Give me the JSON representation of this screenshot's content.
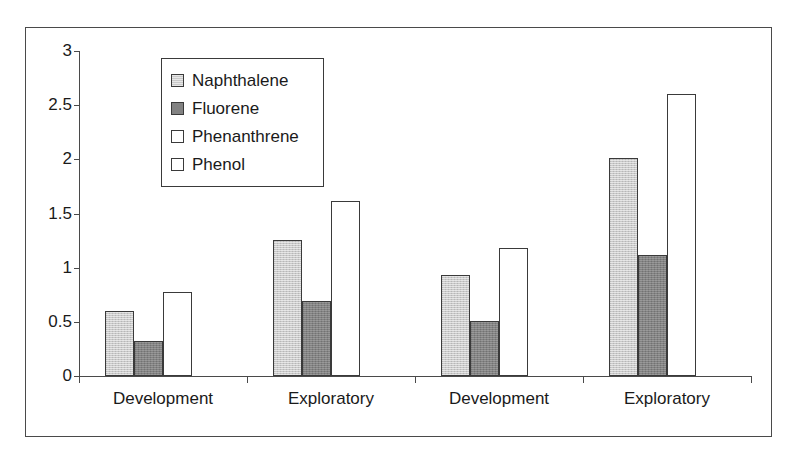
{
  "chart_data": {
    "type": "bar",
    "title": "",
    "xlabel": "",
    "ylabel": "",
    "ylim": [
      0,
      3
    ],
    "ytick_labels": [
      "3",
      "2.5",
      "2",
      "1.5",
      "1",
      "0.5",
      "0"
    ],
    "ytick_values": [
      3,
      2.5,
      2,
      1.5,
      1,
      0.5,
      0
    ],
    "grid": false,
    "legend_position": "top-left inside plot",
    "categories": [
      "Development",
      "Exploratory",
      "Development",
      "Exploratory"
    ],
    "series": [
      {
        "name": "Naphthalene",
        "values": [
          0.6,
          1.26,
          0.93,
          2.01
        ]
      },
      {
        "name": "Fluorene",
        "values": [
          0.32,
          0.69,
          0.51,
          1.12
        ]
      },
      {
        "name": "Phenanthrene",
        "values": [
          0.78,
          1.62,
          1.18,
          2.6
        ]
      },
      {
        "name": "Phenol",
        "values": [
          0,
          0,
          0,
          0
        ]
      }
    ]
  },
  "legend": {
    "items": [
      {
        "label": "Naphthalene"
      },
      {
        "label": "Fluorene"
      },
      {
        "label": "Phenanthrene"
      },
      {
        "label": "Phenol"
      }
    ]
  },
  "colors": {
    "series_0": "#c9c9c9",
    "series_1": "#828282",
    "series_2": "#ffffff",
    "series_3": "#ffffff",
    "axis": "#4a4a4a",
    "text": "#1a1a1a",
    "frame": "#4a4a4a",
    "background": "#ffffff"
  }
}
